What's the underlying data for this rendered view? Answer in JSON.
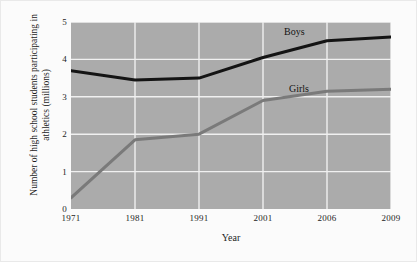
{
  "chart_data": {
    "type": "line",
    "title": "",
    "subtitle": "",
    "xlabel": "Year",
    "ylabel": "Number of high school students participating in athletics (millions)",
    "categories": [
      "1971",
      "1981",
      "1991",
      "2001",
      "2006",
      "2009"
    ],
    "x_tick_labels": [
      "1971",
      "1981",
      "1991",
      "2001",
      "2006",
      "2009"
    ],
    "y_tick_labels": [
      "0",
      "1",
      "2",
      "3",
      "4",
      "5"
    ],
    "y_ticks": [
      0,
      1,
      2,
      3,
      4,
      5
    ],
    "ylim": [
      0,
      5
    ],
    "grid": true,
    "legend_position": "inline-annotation",
    "plot_background_color": "#ababab",
    "gridline_color": "#f0f0f0",
    "figure_background_color": "#fbfbfb",
    "series": [
      {
        "name": "Boys",
        "color": "#141414",
        "line_width": 3,
        "values": [
          3.7,
          3.45,
          3.5,
          4.05,
          4.5,
          4.6
        ]
      },
      {
        "name": "Girls",
        "color": "#7a7a7a",
        "line_width": 3,
        "values": [
          0.3,
          1.85,
          2.0,
          2.9,
          3.15,
          3.2
        ]
      }
    ],
    "annotations": [
      {
        "text": "Boys",
        "series": "Boys"
      },
      {
        "text": "Girls",
        "series": "Girls"
      }
    ]
  }
}
